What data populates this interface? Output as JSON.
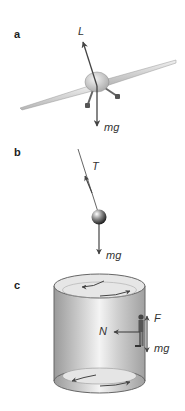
{
  "panels": [
    {
      "label": "a",
      "subject": "airplane banking",
      "forces": [
        {
          "symbol": "L",
          "name": "lift"
        },
        {
          "symbol": "mg",
          "name": "weight"
        }
      ]
    },
    {
      "label": "b",
      "subject": "pendulum bob on string",
      "forces": [
        {
          "symbol": "T",
          "name": "tension"
        },
        {
          "symbol": "mg",
          "name": "weight"
        }
      ]
    },
    {
      "label": "c",
      "subject": "person on wall of rotating cylinder",
      "forces": [
        {
          "symbol": "N",
          "name": "normal force"
        },
        {
          "symbol": "F",
          "name": "friction"
        },
        {
          "symbol": "mg",
          "name": "weight"
        }
      ]
    }
  ],
  "colors": {
    "arrow": "#444444",
    "body_gray": "#cfcfcf",
    "text": "#333333"
  }
}
